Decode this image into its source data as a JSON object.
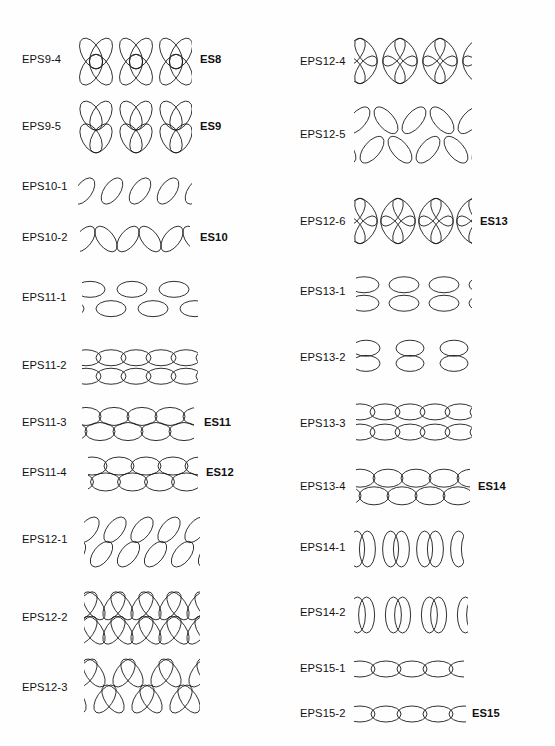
{
  "figure": {
    "type": "ellipse-pattern-plate",
    "background_color": "#fefefe",
    "stroke_color": "#1a1a1a",
    "columns": 2,
    "row_count": 22
  },
  "rows": [
    {
      "id": "EPS9-4",
      "label": "EPS9-4",
      "right_label": "ES8",
      "column": "left",
      "top": 30,
      "label_y": 60,
      "pattern_x": 74,
      "pattern_w": 118,
      "pattern_h": 56,
      "right_label_x": 200,
      "motif": "crossed-pair-arch",
      "bands": 1,
      "units": 3,
      "rx": 9,
      "ry": 17,
      "tilt": 30,
      "step": 40,
      "open_ends": true
    },
    {
      "id": "EPS9-5",
      "label": "EPS9-5",
      "right_label": "ES9",
      "column": "left",
      "top": 100,
      "label_y": 127,
      "pattern_x": 74,
      "pattern_w": 118,
      "pattern_h": 54,
      "right_label_x": 200,
      "motif": "crossed-pair-band",
      "bands": 2,
      "units": 3,
      "rx": 9,
      "ry": 16,
      "tilt": 30,
      "step": 40,
      "open_ends": true
    },
    {
      "id": "EPS10-1",
      "label": "EPS10-1",
      "right_label": "",
      "column": "left",
      "top": 176,
      "label_y": 187,
      "pattern_x": 78,
      "pattern_w": 114,
      "pattern_h": 30,
      "right_label_x": 0,
      "motif": "tilted-row-spaced",
      "bands": 1,
      "units": 4,
      "rx": 8,
      "ry": 15,
      "tilt": 35,
      "step": 28,
      "open_ends": true
    },
    {
      "id": "EPS10-2",
      "label": "EPS10-2",
      "right_label": "ES10",
      "column": "left",
      "top": 223,
      "label_y": 238,
      "pattern_x": 80,
      "pattern_w": 110,
      "pattern_h": 32,
      "right_label_x": 200,
      "motif": "tilted-chain",
      "bands": 1,
      "units": 5,
      "rx": 8,
      "ry": 15,
      "tilt": 38,
      "step": 22,
      "open_ends": true
    },
    {
      "id": "EPS11-1",
      "label": "EPS11-1",
      "right_label": "",
      "column": "left",
      "top": 276,
      "label_y": 298,
      "pattern_x": 82,
      "pattern_w": 116,
      "pattern_h": 46,
      "right_label_x": 0,
      "motif": "flat-grid-offset",
      "bands": 2,
      "units": 3,
      "rx": 15,
      "ry": 8,
      "tilt": 0,
      "step": 42,
      "open_ends": true
    },
    {
      "id": "EPS11-2",
      "label": "EPS11-2",
      "right_label": "",
      "column": "left",
      "top": 345,
      "label_y": 366,
      "pattern_x": 82,
      "pattern_w": 116,
      "pattern_h": 44,
      "right_label_x": 0,
      "motif": "flat-chain-stack",
      "bands": 2,
      "units": 5,
      "rx": 15,
      "ry": 8,
      "tilt": 0,
      "step": 25,
      "open_ends": true
    },
    {
      "id": "EPS11-3",
      "label": "EPS11-3",
      "right_label": "ES11",
      "column": "left",
      "top": 406,
      "label_y": 423,
      "pattern_x": 82,
      "pattern_w": 112,
      "pattern_h": 36,
      "right_label_x": 204,
      "motif": "flat-chain-brick",
      "bands": 2,
      "units": 4,
      "rx": 15,
      "ry": 9,
      "tilt": 0,
      "step": 28,
      "open_ends": true
    },
    {
      "id": "EPS11-4",
      "label": "EPS11-4",
      "right_label": "ES12",
      "column": "left",
      "top": 455,
      "label_y": 473,
      "pattern_x": 88,
      "pattern_w": 110,
      "pattern_h": 38,
      "right_label_x": 206,
      "motif": "flat-chain-brick-dense",
      "bands": 2,
      "units": 4,
      "rx": 15,
      "ry": 9,
      "tilt": 0,
      "step": 27,
      "open_ends": true
    },
    {
      "id": "EPS12-1",
      "label": "EPS12-1",
      "right_label": "",
      "column": "left",
      "top": 513,
      "label_y": 540,
      "pattern_x": 84,
      "pattern_w": 116,
      "pattern_h": 58,
      "right_label_x": 0,
      "motif": "tilted-grid-two-band",
      "bands": 2,
      "units": 4,
      "rx": 8,
      "ry": 15,
      "tilt": 38,
      "step": 27,
      "open_ends": true
    },
    {
      "id": "EPS12-2",
      "label": "EPS12-2",
      "right_label": "",
      "column": "left",
      "top": 589,
      "label_y": 618,
      "pattern_x": 84,
      "pattern_w": 116,
      "pattern_h": 58,
      "right_label_x": 0,
      "motif": "bowtie-rosette",
      "bands": 2,
      "units": 4,
      "rx": 8,
      "ry": 16,
      "tilt": 34,
      "step": 28,
      "open_ends": true
    },
    {
      "id": "EPS12-3",
      "label": "EPS12-3",
      "right_label": "",
      "column": "left",
      "top": 655,
      "label_y": 688,
      "pattern_x": 84,
      "pattern_w": 116,
      "pattern_h": 62,
      "right_label_x": 0,
      "motif": "bowtie-offset",
      "bands": 2,
      "units": 3,
      "rx": 8,
      "ry": 16,
      "tilt": 34,
      "step": 38,
      "open_ends": true
    },
    {
      "id": "EPS12-4",
      "label": "EPS12-4",
      "right_label": "",
      "column": "right",
      "top": 32,
      "label_y": 62,
      "pattern_x": 76,
      "pattern_w": 118,
      "pattern_h": 58,
      "right_label_x": 0,
      "motif": "four-petal-rosette",
      "bands": 1,
      "units": 3,
      "rx": 8,
      "ry": 16,
      "tilt": 35,
      "step": 40,
      "open_ends": true
    },
    {
      "id": "EPS12-5",
      "label": "EPS12-5",
      "right_label": "",
      "column": "right",
      "top": 100,
      "label_y": 135,
      "pattern_x": 76,
      "pattern_w": 118,
      "pattern_h": 70,
      "right_label_x": 0,
      "motif": "tilted-chain-two-band",
      "bands": 2,
      "units": 4,
      "rx": 8,
      "ry": 16,
      "tilt": 40,
      "step": 28,
      "open_ends": true
    },
    {
      "id": "EPS12-6",
      "label": "EPS12-6",
      "right_label": "ES13",
      "column": "right",
      "top": 192,
      "label_y": 222,
      "pattern_x": 76,
      "pattern_w": 118,
      "pattern_h": 58,
      "right_label_x": 202,
      "motif": "four-petal-rosette-linked",
      "bands": 1,
      "units": 3,
      "rx": 8,
      "ry": 16,
      "tilt": 35,
      "step": 38,
      "open_ends": true
    },
    {
      "id": "EPS13-1",
      "label": "EPS13-1",
      "right_label": "",
      "column": "right",
      "top": 272,
      "label_y": 292,
      "pattern_x": 78,
      "pattern_w": 116,
      "pattern_h": 44,
      "right_label_x": 0,
      "motif": "flat-grid-aligned",
      "bands": 2,
      "units": 3,
      "rx": 15,
      "ry": 8,
      "tilt": 0,
      "step": 40,
      "open_ends": true
    },
    {
      "id": "EPS13-2",
      "label": "EPS13-2",
      "right_label": "",
      "column": "right",
      "top": 335,
      "label_y": 358,
      "pattern_x": 78,
      "pattern_w": 116,
      "pattern_h": 44,
      "right_label_x": 0,
      "motif": "flat-stack-column",
      "bands": 2,
      "units": 3,
      "rx": 14,
      "ry": 8,
      "tilt": 0,
      "step": 44,
      "open_ends": true
    },
    {
      "id": "EPS13-3",
      "label": "EPS13-3",
      "right_label": "",
      "column": "right",
      "top": 398,
      "label_y": 424,
      "pattern_x": 78,
      "pattern_w": 116,
      "pattern_h": 48,
      "right_label_x": 0,
      "motif": "flat-chain-stack-aligned",
      "bands": 2,
      "units": 5,
      "rx": 15,
      "ry": 8,
      "tilt": 0,
      "step": 25,
      "open_ends": true
    },
    {
      "id": "EPS13-4",
      "label": "EPS13-4",
      "right_label": "ES14",
      "column": "right",
      "top": 466,
      "label_y": 487,
      "pattern_x": 78,
      "pattern_w": 114,
      "pattern_h": 42,
      "right_label_x": 200,
      "motif": "flat-chain-stack-linked",
      "bands": 2,
      "units": 4,
      "rx": 15,
      "ry": 9,
      "tilt": 0,
      "step": 28,
      "open_ends": true
    },
    {
      "id": "EPS14-1",
      "label": "EPS14-1",
      "right_label": "",
      "column": "right",
      "top": 528,
      "label_y": 548,
      "pattern_x": 76,
      "pattern_w": 110,
      "pattern_h": 42,
      "right_label_x": 0,
      "motif": "upright-pairs",
      "bands": 1,
      "units": 3,
      "rx": 8,
      "ry": 18,
      "tilt": 0,
      "step": 34,
      "open_ends": true
    },
    {
      "id": "EPS14-2",
      "label": "EPS14-2",
      "right_label": "",
      "column": "right",
      "top": 595,
      "label_y": 613,
      "pattern_x": 76,
      "pattern_w": 114,
      "pattern_h": 40,
      "right_label_x": 0,
      "motif": "upright-pairs-tight",
      "bands": 1,
      "units": 3,
      "rx": 8,
      "ry": 18,
      "tilt": 0,
      "step": 36,
      "open_ends": true
    },
    {
      "id": "EPS15-1",
      "label": "EPS15-1",
      "right_label": "",
      "column": "right",
      "top": 655,
      "label_y": 669,
      "pattern_x": 76,
      "pattern_w": 110,
      "pattern_h": 28,
      "right_label_x": 0,
      "motif": "flat-chain-single",
      "bands": 1,
      "units": 4,
      "rx": 15,
      "ry": 8,
      "tilt": 0,
      "step": 26,
      "open_ends": true
    },
    {
      "id": "EPS15-2",
      "label": "EPS15-2",
      "right_label": "ES15",
      "column": "right",
      "top": 700,
      "label_y": 714,
      "pattern_x": 76,
      "pattern_w": 112,
      "pattern_h": 28,
      "right_label_x": 194,
      "motif": "flat-chain-single-linked",
      "bands": 1,
      "units": 4,
      "rx": 15,
      "ry": 8,
      "tilt": 0,
      "step": 26,
      "open_ends": true
    }
  ]
}
